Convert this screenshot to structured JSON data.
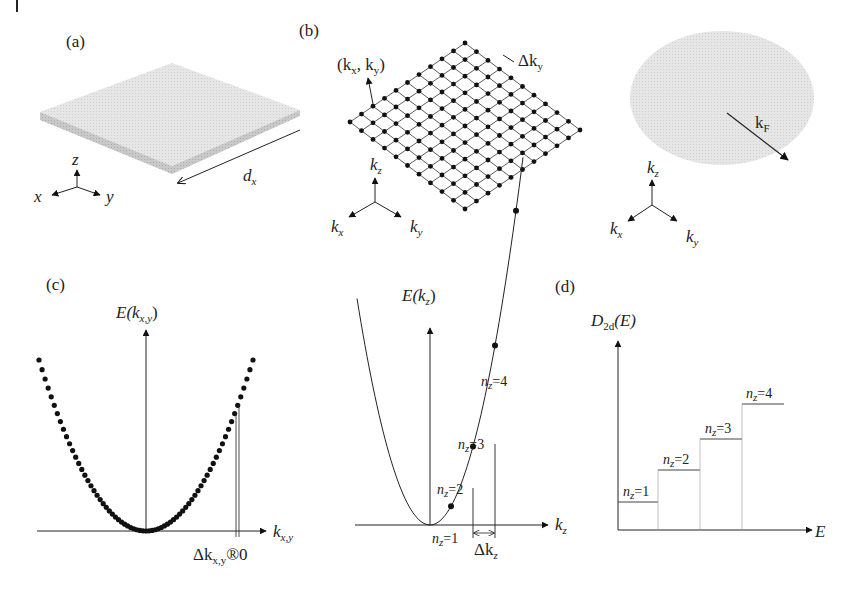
{
  "figure": {
    "panels": {
      "a": {
        "label": "(a)",
        "description": "thin slab (quantum well) with thickness along x",
        "dimension_label": "d",
        "dimension_sub": "x",
        "axes": {
          "z": "z",
          "x": "x",
          "y": "y"
        }
      },
      "b": {
        "label": "(b)",
        "lattice_label_open": "(k",
        "lattice_label_x": "x",
        "lattice_label_mid": ", k",
        "lattice_label_y": "y",
        "lattice_label_close": ")",
        "spacing_label": "Δk",
        "spacing_sub": "y",
        "grid_size": 10,
        "axes": {
          "kz": "k",
          "kz_sub": "z",
          "kx": "k",
          "kx_sub": "x",
          "ky": "k",
          "ky_sub": "y"
        }
      },
      "b_fermi": {
        "radius_label": "k",
        "radius_sub": "F",
        "axes": {
          "kz": "k",
          "kz_sub": "z",
          "kx": "k",
          "kx_sub": "x",
          "ky": "k",
          "ky_sub": "y"
        }
      },
      "c": {
        "label": "(c)",
        "left_plot": {
          "ylabel": "E(k",
          "ylabel_sub": "x,y",
          "ylabel_close": ")",
          "xlabel": "k",
          "xlabel_sub": "x,y",
          "annotation": "Δk",
          "annotation_sub": "x,y",
          "annotation_tail": "®0"
        },
        "right_plot": {
          "ylabel": "E(k",
          "ylabel_sub": "z",
          "ylabel_close": ")",
          "xlabel": "k",
          "xlabel_sub": "z",
          "levels": [
            {
              "n": "n",
              "sub": "z",
              "eq": "=1"
            },
            {
              "n": "n",
              "sub": "z",
              "eq": "=2"
            },
            {
              "n": "n",
              "sub": "z",
              "eq": "=3"
            },
            {
              "n": "n",
              "sub": "z",
              "eq": "=4"
            }
          ],
          "spacing_label": "Δk",
          "spacing_sub": "z"
        }
      },
      "d": {
        "label": "(d)",
        "ylabel": "D",
        "ylabel_sub": "2d",
        "ylabel_tail": "(E)",
        "xlabel": "E",
        "steps": [
          {
            "n": "n",
            "sub": "z",
            "eq": "=1"
          },
          {
            "n": "n",
            "sub": "z",
            "eq": "=2"
          },
          {
            "n": "n",
            "sub": "z",
            "eq": "=3"
          },
          {
            "n": "n",
            "sub": "z",
            "eq": "=4"
          }
        ]
      }
    }
  },
  "chart_data": [
    {
      "type": "line",
      "title": "(c) E(k_x,y) quasi-continuous parabolic dispersion",
      "xlabel": "k_x,y",
      "ylabel": "E(k_x,y)",
      "description": "densely spaced dots forming parabola E ∝ k²; Δk_x,y → 0",
      "x": [
        -1.0,
        -0.75,
        -0.5,
        -0.25,
        0,
        0.25,
        0.5,
        0.75,
        1.0
      ],
      "values": [
        1.0,
        0.5625,
        0.25,
        0.0625,
        0,
        0.0625,
        0.25,
        0.5625,
        1.0
      ]
    },
    {
      "type": "line",
      "title": "(c) E(k_z) discrete levels",
      "xlabel": "k_z",
      "ylabel": "E(k_z)",
      "points": [
        {
          "label": "n_z=1",
          "k": 1,
          "E": 1
        },
        {
          "label": "n_z=2",
          "k": 2,
          "E": 4
        },
        {
          "label": "n_z=3",
          "k": 3,
          "E": 9
        },
        {
          "label": "n_z=4",
          "k": 4,
          "E": 16
        }
      ],
      "annotation": "Δk_z"
    },
    {
      "type": "line",
      "title": "(d) 2D density of states (step function)",
      "xlabel": "E",
      "ylabel": "D_2d(E)",
      "categories": [
        "n_z=1",
        "n_z=2",
        "n_z=3",
        "n_z=4"
      ],
      "values": [
        1,
        2,
        3,
        4
      ]
    }
  ]
}
